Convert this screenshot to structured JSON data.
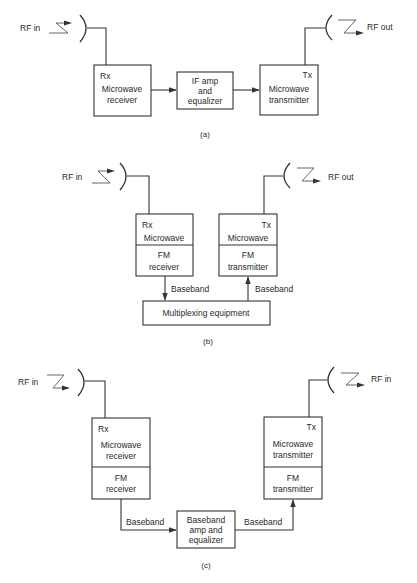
{
  "figure": {
    "panels": [
      {
        "id": "a",
        "caption": "(a)",
        "rf_in_label": "RF in",
        "rf_out_label": "RF out",
        "receiver": {
          "tag": "Rx",
          "line1": "Microwave",
          "line2": "receiver"
        },
        "middle": {
          "line1": "IF amp",
          "line2": "and",
          "line3": "equalizer"
        },
        "transmitter": {
          "tag": "Tx",
          "line1": "Microwave",
          "line2": "transmitter"
        }
      },
      {
        "id": "b",
        "caption": "(b)",
        "rf_in_label": "RF in",
        "rf_out_label": "RF out",
        "receiver": {
          "tag": "Rx",
          "top": "Microwave",
          "bottom_line1": "FM",
          "bottom_line2": "receiver"
        },
        "transmitter": {
          "tag": "Tx",
          "top": "Microwave",
          "bottom_line1": "FM",
          "bottom_line2": "transmitter"
        },
        "baseband_down": "Baseband",
        "baseband_up": "Baseband",
        "mux": "Multiplexing equipment"
      },
      {
        "id": "c",
        "caption": "(c)",
        "rf_in_label": "RF in",
        "rf_out_label": "RF in",
        "receiver": {
          "tag": "Rx",
          "top_line1": "Microwave",
          "top_line2": "receiver",
          "bottom_line1": "FM",
          "bottom_line2": "receiver"
        },
        "transmitter": {
          "tag": "Tx",
          "top_line1": "Microwave",
          "top_line2": "transmitter",
          "bottom_line1": "FM",
          "bottom_line2": "transmitter"
        },
        "middle": {
          "line1": "Baseband",
          "line2": "amp and",
          "line3": "equalizer"
        },
        "baseband_left": "Baseband",
        "baseband_right": "Baseband"
      }
    ]
  },
  "colors": {
    "line": "#333333",
    "text": "#2a2a2a",
    "background": "#ffffff"
  }
}
